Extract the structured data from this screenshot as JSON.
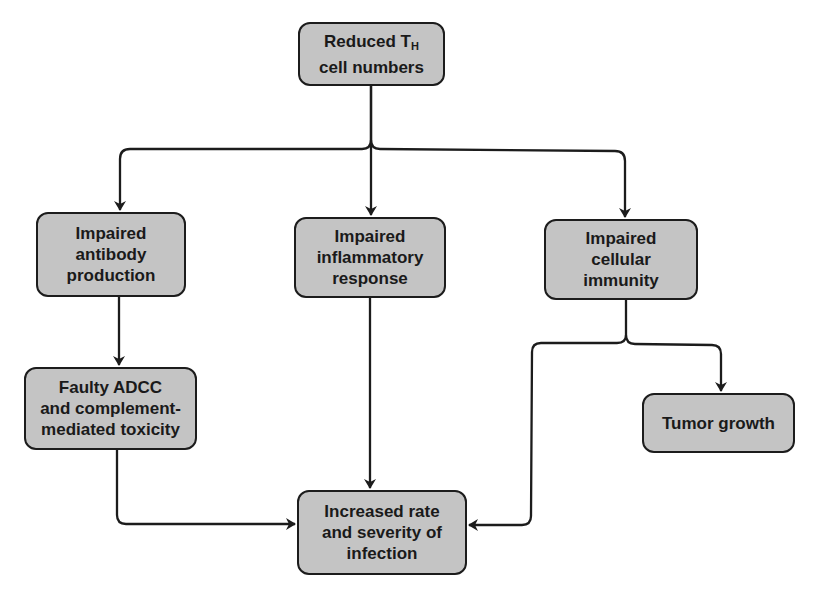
{
  "diagram": {
    "type": "flowchart",
    "colors": {
      "box_fill": "#c4c4c4",
      "border": "#1c1c1c",
      "text": "#1a1a1a",
      "background": "#ffffff"
    },
    "nodes": {
      "reduced_th": {
        "line1_main": "Reduced T",
        "line1_sub": "H",
        "line2": "cell numbers"
      },
      "antibody": {
        "lines": [
          "Impaired",
          "antibody",
          "production"
        ]
      },
      "inflammatory": {
        "lines": [
          "Impaired",
          "inflammatory",
          "response"
        ]
      },
      "cellular": {
        "lines": [
          "Impaired",
          "cellular",
          "immunity"
        ]
      },
      "adcc": {
        "lines": [
          "Faulty ADCC",
          "and complement-",
          "mediated toxicity"
        ]
      },
      "tumor": {
        "lines": [
          "Tumor growth"
        ]
      },
      "infection": {
        "lines": [
          "Increased rate",
          "and severity of",
          "infection"
        ]
      }
    },
    "edges": [
      {
        "from": "Reduced TH cell numbers",
        "to": "Impaired antibody production"
      },
      {
        "from": "Reduced TH cell numbers",
        "to": "Impaired inflammatory response"
      },
      {
        "from": "Reduced TH cell numbers",
        "to": "Impaired cellular immunity"
      },
      {
        "from": "Impaired antibody production",
        "to": "Faulty ADCC and complement-mediated toxicity"
      },
      {
        "from": "Impaired inflammatory response",
        "to": "Increased rate and severity of infection"
      },
      {
        "from": "Impaired cellular immunity",
        "to": "Tumor growth"
      },
      {
        "from": "Impaired cellular immunity",
        "to": "Increased rate and severity of infection"
      },
      {
        "from": "Faulty ADCC and complement-mediated toxicity",
        "to": "Increased rate and severity of infection"
      }
    ]
  }
}
